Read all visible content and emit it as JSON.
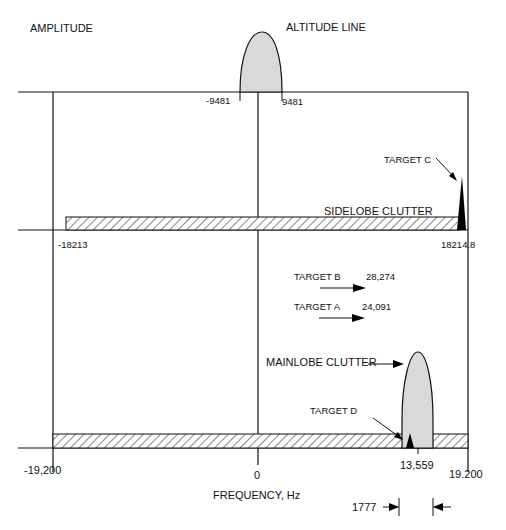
{
  "labels": {
    "amplitude": "AMPLITUDE",
    "altitude_line": "ALTITUDE LINE",
    "neg_9481": "-9481",
    "pos_9481": "9481",
    "target_c": "TARGET C",
    "sidelobe_clutter": "SIDELOBE CLUTTER",
    "neg_18213": "-18213",
    "pos_18214": "18214.8",
    "target_b": "TARGET B",
    "target_b_freq": "28,274",
    "target_a": "TARGET A",
    "target_a_freq": "24,091",
    "mainlobe_clutter": "MAINLOBE CLUTTER",
    "target_d": "TARGET D",
    "neg_19200": "-19,200",
    "zero": "0",
    "freq_13559": "13,559",
    "pos_19200": "19.200",
    "xaxis": "FREQUENCY, Hz",
    "width_1777": "1777"
  },
  "colors": {
    "line": "#111111",
    "lobe_fill": "#d9d9d9",
    "target_fill": "#000000"
  }
}
